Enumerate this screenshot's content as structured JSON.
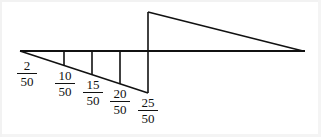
{
  "figure": {
    "type": "geometric-diagram",
    "background_color": "#ffffff",
    "stroke_color": "#111111",
    "baseline": {
      "y": 51,
      "x_start": 20,
      "x_end": 305
    },
    "lower_triangle": {
      "apex": [
        20,
        51
      ],
      "foot": [
        148,
        93
      ],
      "closing_vertical_x": 148
    },
    "upper_triangle": {
      "apex": [
        148,
        12
      ],
      "base_right": [
        303,
        51
      ],
      "base_left": [
        148,
        51
      ]
    },
    "stations": [
      {
        "label_numerator": "2",
        "label_denominator": "50",
        "x": 20,
        "tick_bottom_y": 51,
        "label_left": 17,
        "label_top": 59
      },
      {
        "label_numerator": "10",
        "label_denominator": "50",
        "x": 64,
        "tick_bottom_y": 66,
        "label_left": 55,
        "label_top": 69
      },
      {
        "label_numerator": "15",
        "label_denominator": "50",
        "x": 92,
        "tick_bottom_y": 75,
        "label_left": 83,
        "label_top": 78
      },
      {
        "label_numerator": "20",
        "label_denominator": "50",
        "x": 120,
        "tick_bottom_y": 84,
        "label_left": 110,
        "label_top": 87
      },
      {
        "label_numerator": "25",
        "label_denominator": "50",
        "x": 148,
        "tick_bottom_y": 93,
        "label_left": 138,
        "label_top": 96
      }
    ],
    "fraction_bar_width_px": 20
  }
}
